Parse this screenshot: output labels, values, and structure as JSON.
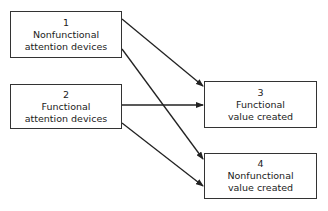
{
  "diagram": {
    "nodes": [
      {
        "id": "1",
        "number": "1",
        "line1": "Nonfunctional",
        "line2": "attention devices"
      },
      {
        "id": "2",
        "number": "2",
        "line1": "Functional",
        "line2": "attention devices"
      },
      {
        "id": "3",
        "number": "3",
        "line1": "Functional",
        "line2": "value created"
      },
      {
        "id": "4",
        "number": "4",
        "line1": "Nonfunctional",
        "line2": "value created"
      }
    ],
    "edges": [
      {
        "from": "1",
        "to": "3"
      },
      {
        "from": "1",
        "to": "4"
      },
      {
        "from": "2",
        "to": "3"
      },
      {
        "from": "2",
        "to": "4"
      }
    ]
  }
}
